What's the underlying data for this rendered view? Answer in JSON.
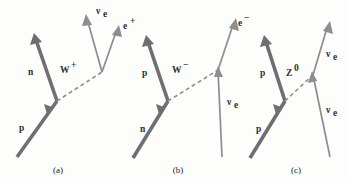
{
  "figure": {
    "background_color": "#fdfdfc",
    "thick_line_color": "#6e6e73",
    "thin_line_color": "#8d8d92",
    "label_color": "#2e2e33"
  },
  "panels": [
    {
      "id": "a",
      "caption": "(a)",
      "process": "p to n + W+ ; W+ to e+ + nu_e",
      "labels": {
        "incoming_baryon": "p",
        "outgoing_baryon": "n",
        "boson": "W",
        "boson_charge": "+",
        "lepton_upper": "ν",
        "lepton_upper_sub": "e",
        "lepton_right": "e",
        "lepton_right_charge": "+"
      }
    },
    {
      "id": "b",
      "caption": "(b)",
      "process": "n to p + W- ; W- to e- + anti-nu_e",
      "labels": {
        "incoming_baryon": "n",
        "outgoing_baryon": "p",
        "boson": "W",
        "boson_charge": "−",
        "lepton_upper": "e",
        "lepton_upper_charge": "−",
        "lepton_lower": "ν",
        "lepton_lower_sub": "e"
      }
    },
    {
      "id": "c",
      "caption": "(c)",
      "process": "p + nu_e to p + nu_e via Z0 exchange",
      "labels": {
        "incoming_baryon": "p",
        "outgoing_baryon": "p",
        "boson": "Z",
        "boson_charge": "0",
        "lepton_upper": "ν",
        "lepton_upper_sub": "e",
        "lepton_lower": "ν",
        "lepton_lower_sub": "e"
      }
    }
  ]
}
